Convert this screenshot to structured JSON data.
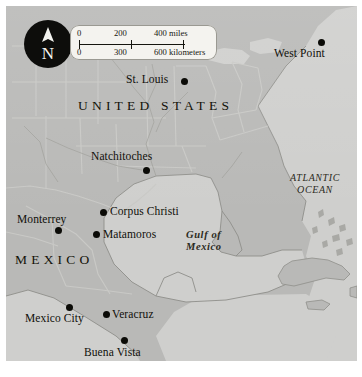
{
  "map": {
    "title": "Map of the United States, Mexico and the Gulf of Mexico",
    "background_color": "#b9b9b7",
    "land_color": "#b9b9b7",
    "water_color": "#cfcfcd",
    "border_color": "#a6a6a2",
    "label_color": "#100f0a",
    "compass": {
      "icon": "compass-rose-icon",
      "cardinal": "N",
      "circle_color": "#0d0d0b",
      "needle_color": "#f2f2ee"
    },
    "scale": {
      "miles": {
        "start": "0",
        "mid": "200",
        "end": "400 miles"
      },
      "kilometers": {
        "start": "0",
        "mid": "300",
        "end": "600 kilometers"
      }
    },
    "regions": [
      {
        "name": "united-states",
        "label": "UNITED STATES"
      },
      {
        "name": "mexico",
        "label": "MEXICO"
      }
    ],
    "water_bodies": [
      {
        "name": "atlantic-ocean",
        "line1": "ATLANTIC",
        "line2": "OCEAN"
      },
      {
        "name": "gulf-of-mexico",
        "line1": "Gulf of",
        "line2": "Mexico"
      }
    ],
    "cities": [
      {
        "name": "west-point",
        "label": "West Point"
      },
      {
        "name": "st-louis",
        "label": "St. Louis"
      },
      {
        "name": "natchitoches",
        "label": "Natchitoches"
      },
      {
        "name": "corpus-christi",
        "label": "Corpus Christi"
      },
      {
        "name": "monterrey",
        "label": "Monterrey"
      },
      {
        "name": "matamoros",
        "label": "Matamoros"
      },
      {
        "name": "mexico-city",
        "label": "Mexico City"
      },
      {
        "name": "veracruz",
        "label": "Veracruz"
      },
      {
        "name": "buena-vista",
        "label": "Buena Vista"
      }
    ]
  }
}
